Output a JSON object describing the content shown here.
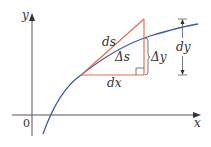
{
  "diagram": {
    "colors": {
      "axes": "#555555",
      "curve": "#3b56a8",
      "triangle": "#e06a4a",
      "dimension": "#555555",
      "text": "#333333",
      "background": "#ffffff"
    },
    "axes": {
      "x_label": "x",
      "y_label": "y",
      "origin_label": "0"
    },
    "labels": {
      "ds": "ds",
      "delta_s": "Δs",
      "delta_y": "Δy",
      "dx": "dx",
      "dy": "dy"
    },
    "elements": [
      {
        "name": "curve",
        "description": "increasing concave-down curve y=f(x)"
      },
      {
        "name": "tangent-triangle",
        "description": "right triangle with hypotenuse ds along tangent, legs dx and dy"
      },
      {
        "name": "right-angle-marker",
        "description": "small square at right angle"
      },
      {
        "name": "delta-y-bracket",
        "description": "bracket showing Δy from curve to base"
      },
      {
        "name": "dy-dimension",
        "description": "double-arrow dimension line for dy"
      }
    ]
  }
}
